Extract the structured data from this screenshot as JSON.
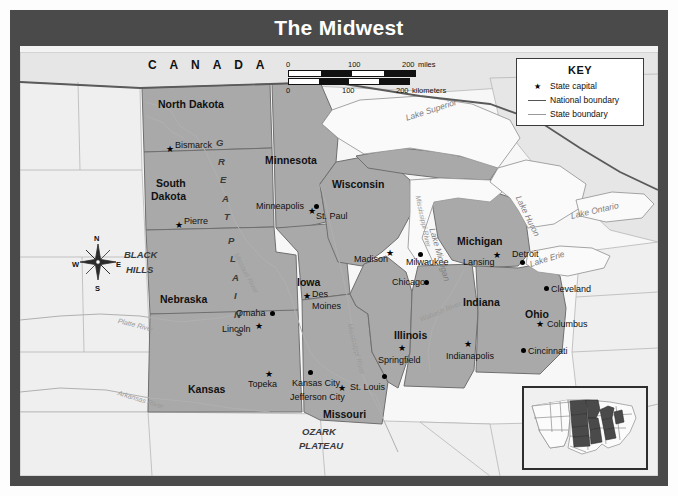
{
  "title": "The Midwest",
  "key": {
    "heading": "KEY",
    "items": [
      {
        "symbol": "star-icon",
        "label": "State capital"
      },
      {
        "symbol": "thick-line-icon",
        "label": "National boundary"
      },
      {
        "symbol": "thin-line-icon",
        "label": "State boundary"
      }
    ]
  },
  "scale": {
    "miles": {
      "ticks": [
        "0",
        "100",
        "200"
      ],
      "unit": "miles"
    },
    "kilometers": {
      "ticks": [
        "0",
        "100",
        "200"
      ],
      "unit": "kilometers"
    }
  },
  "compass": {
    "n": "N",
    "s": "S",
    "e": "E",
    "w": "W"
  },
  "country_label": "C A N A D A",
  "states": [
    {
      "name": "North Dakota",
      "x": 138,
      "y": 47
    },
    {
      "name": "South Dakota",
      "x": 131,
      "y": 133,
      "line2": "Dakota"
    },
    {
      "name": "Minnesota",
      "x": 245,
      "y": 103
    },
    {
      "name": "Wisconsin",
      "x": 312,
      "y": 127
    },
    {
      "name": "Michigan",
      "x": 437,
      "y": 184
    },
    {
      "name": "Nebraska",
      "x": 140,
      "y": 242
    },
    {
      "name": "Iowa",
      "x": 277,
      "y": 225
    },
    {
      "name": "Illinois",
      "x": 374,
      "y": 278
    },
    {
      "name": "Indiana",
      "x": 443,
      "y": 245
    },
    {
      "name": "Ohio",
      "x": 505,
      "y": 257
    },
    {
      "name": "Kansas",
      "x": 168,
      "y": 332
    },
    {
      "name": "Missouri",
      "x": 303,
      "y": 357
    }
  ],
  "capitals": [
    {
      "name": "Bismarck",
      "x": 155,
      "y": 89
    },
    {
      "name": "Pierre",
      "x": 164,
      "y": 165
    },
    {
      "name": "St. Paul",
      "x": 296,
      "y": 160
    },
    {
      "name": "Madison",
      "x": 344,
      "y": 203
    },
    {
      "name": "Lansing",
      "x": 443,
      "y": 206
    },
    {
      "name": "Des Moines",
      "x": 290,
      "y": 244
    },
    {
      "name": "Lincoln",
      "x": 202,
      "y": 273
    },
    {
      "name": "Springfield",
      "x": 369,
      "y": 300
    },
    {
      "name": "Indianapolis",
      "x": 446,
      "y": 297
    },
    {
      "name": "Columbus",
      "x": 527,
      "y": 270
    },
    {
      "name": "Topeka",
      "x": 224,
      "y": 327
    },
    {
      "name": "Jefferson City",
      "x": 273,
      "y": 341
    }
  ],
  "cities": [
    {
      "name": "Minneapolis",
      "x": 241,
      "y": 152
    },
    {
      "name": "Milwaukee",
      "x": 389,
      "y": 204
    },
    {
      "name": "Detroit",
      "x": 494,
      "y": 198
    },
    {
      "name": "Cleveland",
      "x": 524,
      "y": 235
    },
    {
      "name": "Chicago",
      "x": 376,
      "y": 234
    },
    {
      "name": "Cincinnati",
      "x": 505,
      "y": 295
    },
    {
      "name": "Omaha",
      "x": 213,
      "y": 258
    },
    {
      "name": "Kansas City",
      "x": 271,
      "y": 327
    },
    {
      "name": "St. Louis",
      "x": 332,
      "y": 332
    }
  ],
  "water_bodies": [
    {
      "name": "Lake Superior",
      "x": 398,
      "y": 62,
      "rot": -18
    },
    {
      "name": "Lake Michigan",
      "x": 418,
      "y": 170,
      "rot": -74
    },
    {
      "name": "Lake Huron",
      "x": 502,
      "y": 148,
      "rot": -64
    },
    {
      "name": "Lake Erie",
      "x": 533,
      "y": 205,
      "rot": -17
    },
    {
      "name": "Lake Ontario",
      "x": 578,
      "y": 155,
      "rot": -13
    }
  ],
  "rivers": [
    {
      "name": "Missouri River",
      "x": 218,
      "y": 200,
      "rot": 62
    },
    {
      "name": "Mississippi River",
      "x": 399,
      "y": 142,
      "rot": 78
    },
    {
      "name": "Mississippi River",
      "x": 330,
      "y": 270,
      "rot": 76
    },
    {
      "name": "Platte River",
      "x": 122,
      "y": 265,
      "rot": 14
    },
    {
      "name": "Arkansas River",
      "x": 123,
      "y": 337,
      "rot": 17
    },
    {
      "name": "Wabash River",
      "x": 408,
      "y": 262,
      "rot": -20
    }
  ],
  "regions": [
    {
      "name": "GREAT PLAINS",
      "letters": [
        "G",
        "R",
        "E",
        "A",
        "T",
        "P",
        "L",
        "A",
        "I",
        "N",
        "S"
      ]
    },
    {
      "name": "BLACK HILLS",
      "line1": "BLACK",
      "line2": "HILLS",
      "x": 104,
      "y": 202
    },
    {
      "name": "OZARK PLATEAU",
      "line1": "OZARK",
      "line2": "PLATEAU",
      "x": 281,
      "y": 379
    }
  ],
  "colors": {
    "frame": "#4a4a4a",
    "midwest_fill": "#a9a9a9",
    "other_land": "#ececec",
    "water": "#f7f7f7",
    "inset_highlight": "#4a4a4a",
    "title_text": "#ffffff"
  },
  "inset": {
    "name": "locator-map",
    "description": "United States with Midwest region highlighted"
  }
}
